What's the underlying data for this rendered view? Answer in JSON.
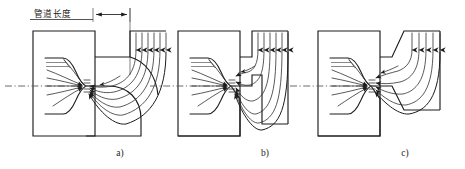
{
  "figure": {
    "type": "engineering-flow-diagram",
    "background_color": "#ffffff",
    "line_color": "#1c1c1c",
    "streamline_color": "#2a2a2a",
    "centerline_color": "#5a5a5a"
  },
  "annotation": {
    "dimension_label": "管道长度",
    "dimension_label_underline": true,
    "arrow_style": "double-headed"
  },
  "panels": [
    {
      "id": "a",
      "caption": "a)",
      "pipe_length": "long",
      "inlet_arrow_count": 6,
      "streamline_count": 7,
      "has_dimension_annotation": true,
      "has_centerline": true
    },
    {
      "id": "b",
      "caption": "b)",
      "pipe_length": "medium",
      "inlet_arrow_count": 6,
      "streamline_count": 7,
      "has_dimension_annotation": false,
      "has_centerline": true
    },
    {
      "id": "c",
      "caption": "c)",
      "pipe_length": "short",
      "inlet_arrow_count": 5,
      "streamline_count": 6,
      "has_dimension_annotation": false,
      "has_centerline": true
    }
  ]
}
